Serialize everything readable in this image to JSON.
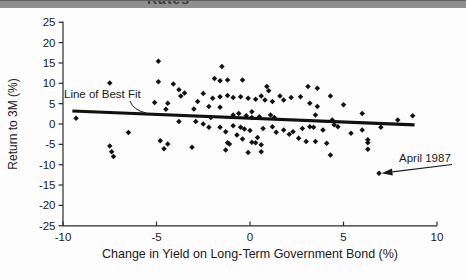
{
  "header": {
    "bar_color": "#8f8f8f",
    "clipped_text": "Rates"
  },
  "chart_data": {
    "type": "scatter",
    "title": "",
    "xlabel": "Change in Yield on Long-Term Government Bond (%)",
    "ylabel": "Return to 3M (%)",
    "xlim": [
      -10,
      10
    ],
    "ylim": [
      -25,
      25
    ],
    "grid": false,
    "legend": "none",
    "marker": "diamond",
    "marker_color": "#111111",
    "axis_color": "#2a2a2a",
    "trend_color": "#111111",
    "x_ticks": [
      -10,
      -5,
      0,
      5,
      10
    ],
    "x_tick_labels": [
      "-10",
      "-5",
      "0",
      "5",
      "10"
    ],
    "y_ticks": [
      25,
      20,
      15,
      10,
      5,
      0,
      -5,
      -10,
      -15,
      -20,
      -25
    ],
    "y_tick_labels": [
      "25",
      "20",
      "15",
      "10",
      "5",
      "0",
      "-5",
      "-10",
      "-15",
      "-20",
      "-25"
    ],
    "trend_line": {
      "x1": -9.5,
      "y1": 3.2,
      "x2": 8.8,
      "y2": -0.2
    },
    "annotations": [
      {
        "text": "Line of Best Fit",
        "points_to": "trend_line"
      },
      {
        "text": "April 1987",
        "points_to": [
          6.9,
          -12.1
        ]
      }
    ],
    "points": [
      [
        -9.3,
        1.4
      ],
      [
        -7.5,
        10.1
      ],
      [
        -7.5,
        -5.4
      ],
      [
        -7.4,
        -6.8
      ],
      [
        -7.3,
        -8.0
      ],
      [
        -6.5,
        -2.1
      ],
      [
        -5.1,
        5.3
      ],
      [
        -4.9,
        15.4
      ],
      [
        -4.9,
        10.4
      ],
      [
        -4.8,
        -4.1
      ],
      [
        -4.6,
        -6.1
      ],
      [
        -4.5,
        3.6
      ],
      [
        -4.4,
        5.1
      ],
      [
        -4.4,
        -4.9
      ],
      [
        -4.1,
        9.8
      ],
      [
        -3.8,
        8.4
      ],
      [
        -3.8,
        0.6
      ],
      [
        -3.7,
        6.9
      ],
      [
        -3.5,
        7.6
      ],
      [
        -3.1,
        -5.7
      ],
      [
        -3.0,
        3.7
      ],
      [
        -2.9,
        0.6
      ],
      [
        -2.8,
        5.5
      ],
      [
        -2.5,
        7.5
      ],
      [
        -2.5,
        0.0
      ],
      [
        -2.2,
        4.3
      ],
      [
        -2.2,
        -0.8
      ],
      [
        -2.1,
        1.6
      ],
      [
        -2.0,
        6.3
      ],
      [
        -1.9,
        11.2
      ],
      [
        -1.6,
        10.6
      ],
      [
        -1.6,
        6.7
      ],
      [
        -1.6,
        4.1
      ],
      [
        -1.6,
        -0.8
      ],
      [
        -1.5,
        14.1
      ],
      [
        -1.3,
        -1.9
      ],
      [
        -1.3,
        -6.4
      ],
      [
        -1.2,
        10.8
      ],
      [
        -1.2,
        7.0
      ],
      [
        -1.2,
        -4.6
      ],
      [
        -1.1,
        -4.9
      ],
      [
        -0.9,
        6.5
      ],
      [
        -0.9,
        2.2
      ],
      [
        -0.9,
        -0.4
      ],
      [
        -0.7,
        -2.7
      ],
      [
        -0.6,
        2.6
      ],
      [
        -0.5,
        6.7
      ],
      [
        -0.5,
        -0.8
      ],
      [
        -0.4,
        10.8
      ],
      [
        -0.4,
        -3.7
      ],
      [
        -0.3,
        -1.2
      ],
      [
        -0.2,
        2.0
      ],
      [
        -0.1,
        6.3
      ],
      [
        -0.1,
        -7.0
      ],
      [
        0.0,
        -1.6
      ],
      [
        0.1,
        3.0
      ],
      [
        0.1,
        1.6
      ],
      [
        0.1,
        -4.5
      ],
      [
        0.3,
        6.1
      ],
      [
        0.3,
        -4.6
      ],
      [
        0.4,
        -3.3
      ],
      [
        0.5,
        1.8
      ],
      [
        0.6,
        6.9
      ],
      [
        0.6,
        -5.1
      ],
      [
        0.6,
        -6.8
      ],
      [
        0.7,
        -1.1
      ],
      [
        0.8,
        5.9
      ],
      [
        0.9,
        9.2
      ],
      [
        1.0,
        8.2
      ],
      [
        1.1,
        2.2
      ],
      [
        1.2,
        5.5
      ],
      [
        1.2,
        -0.7
      ],
      [
        1.3,
        1.6
      ],
      [
        1.4,
        -2.0
      ],
      [
        1.6,
        6.9
      ],
      [
        1.8,
        5.9
      ],
      [
        1.8,
        -1.5
      ],
      [
        2.1,
        -2.5
      ],
      [
        2.2,
        6.5
      ],
      [
        2.3,
        -1.9
      ],
      [
        2.6,
        -3.5
      ],
      [
        2.7,
        6.7
      ],
      [
        2.8,
        -1.1
      ],
      [
        3.0,
        -4.3
      ],
      [
        3.1,
        9.2
      ],
      [
        3.2,
        5.1
      ],
      [
        3.2,
        -0.7
      ],
      [
        3.4,
        -0.8
      ],
      [
        3.5,
        2.2
      ],
      [
        3.5,
        -4.3
      ],
      [
        3.6,
        8.8
      ],
      [
        3.6,
        4.3
      ],
      [
        3.9,
        -1.5
      ],
      [
        4.1,
        -4.7
      ],
      [
        4.3,
        6.9
      ],
      [
        4.3,
        -7.6
      ],
      [
        4.4,
        1.0
      ],
      [
        4.5,
        -0.2
      ],
      [
        4.7,
        -0.7
      ],
      [
        5.0,
        4.7
      ],
      [
        5.4,
        -2.3
      ],
      [
        6.0,
        2.6
      ],
      [
        6.0,
        -1.5
      ],
      [
        6.3,
        -3.9
      ],
      [
        6.3,
        -4.6
      ],
      [
        6.3,
        -6.2
      ],
      [
        6.9,
        -12.1
      ],
      [
        7.0,
        -0.8
      ],
      [
        7.9,
        1.0
      ],
      [
        8.7,
        2.0
      ]
    ]
  }
}
